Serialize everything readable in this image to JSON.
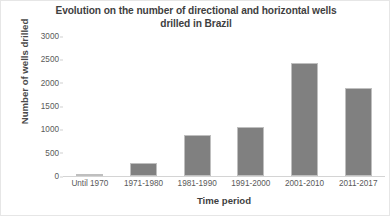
{
  "chart_data": {
    "type": "bar",
    "title": "Evolution on the number of directional and horizontal wells drilled in Brazil",
    "title_lines": [
      "Evolution on the number of directional and horizontal wells",
      "drilled in Brazil"
    ],
    "xlabel": "Time period",
    "ylabel": "Number of wells drilled",
    "categories": [
      "Until 1970",
      "1971-1980",
      "1981-1990",
      "1991-2000",
      "2001-2010",
      "2011-2017"
    ],
    "values": [
      40,
      280,
      880,
      1040,
      2430,
      1890
    ],
    "ylim": [
      0,
      3000
    ],
    "yticks": [
      0,
      500,
      1000,
      1500,
      2000,
      2500,
      3000
    ],
    "ytick_labels": [
      "0",
      "500",
      "1000",
      "1500",
      "2000",
      "2500",
      "3000"
    ],
    "grid": false,
    "legend": null,
    "series": [
      {
        "name": "Wells drilled",
        "values": [
          40,
          280,
          880,
          1040,
          2430,
          1890
        ]
      }
    ],
    "colors": {
      "bar_fill": "#808080",
      "bar_border": "#bfbfbf",
      "title_text": "#3f3f3f",
      "tick_text": "#5a5a5a",
      "axis_line": "#d4d4d4",
      "background": "#ffffff",
      "frame_border": "#e6e6e6"
    }
  }
}
